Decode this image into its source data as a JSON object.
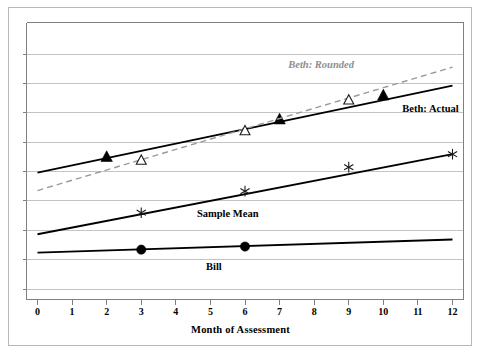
{
  "chart_data": {
    "type": "line",
    "title": "",
    "subtitle": "",
    "xlabel": "Month of Assessment",
    "ylabel": "",
    "xlim": [
      0,
      12
    ],
    "ylim": [
      0,
      9
    ],
    "grid": true,
    "grid_axis": "y",
    "y_tick_labels": [],
    "legend_position": "inline-annotations",
    "x_tick_labels": [
      "0",
      "1",
      "2",
      "3",
      "4",
      "5",
      "6",
      "7",
      "8",
      "9",
      "10",
      "11",
      "12"
    ],
    "x": [
      0,
      1,
      2,
      3,
      4,
      5,
      6,
      7,
      8,
      9,
      10,
      11,
      12
    ],
    "series": [
      {
        "name": "Beth: Actual",
        "label": "Beth: Actual",
        "style": "solid",
        "color": "#000000",
        "line_width": 1.8,
        "marker": "filled-triangle",
        "marker_points": [
          {
            "x": 2,
            "y": 4.63
          },
          {
            "x": 7,
            "y": 5.85
          },
          {
            "x": 10,
            "y": 6.63
          }
        ],
        "trend_endpoints": [
          {
            "x": 0,
            "y": 4.12
          },
          {
            "x": 12,
            "y": 6.95
          }
        ],
        "label_position": {
          "x": 10.55,
          "y": 6.2
        }
      },
      {
        "name": "Beth: Rounded",
        "label": "Beth: Rounded",
        "style": "dashed",
        "color": "#9a9a9a",
        "line_width": 1.4,
        "marker": "open-triangle",
        "marker_points": [
          {
            "x": 3,
            "y": 4.52
          },
          {
            "x": 6,
            "y": 5.48
          },
          {
            "x": 9,
            "y": 6.48
          }
        ],
        "trend_endpoints": [
          {
            "x": 0,
            "y": 3.54
          },
          {
            "x": 12,
            "y": 7.55
          }
        ],
        "label_position": {
          "x": 8.2,
          "y": 7.62
        }
      },
      {
        "name": "Sample Mean",
        "label": "Sample Mean",
        "style": "solid",
        "color": "#000000",
        "line_width": 1.8,
        "marker": "star",
        "marker_points": [
          {
            "x": 3,
            "y": 2.82
          },
          {
            "x": 6,
            "y": 3.52
          },
          {
            "x": 9,
            "y": 4.3
          },
          {
            "x": 12,
            "y": 4.72
          }
        ],
        "trend_endpoints": [
          {
            "x": 0,
            "y": 2.12
          },
          {
            "x": 12,
            "y": 4.72
          }
        ],
        "label_position": {
          "x": 5.5,
          "y": 2.78
        }
      },
      {
        "name": "Bill",
        "label": "Bill",
        "style": "solid",
        "color": "#000000",
        "line_width": 1.8,
        "marker": "filled-circle",
        "marker_points": [
          {
            "x": 3,
            "y": 1.62
          },
          {
            "x": 6,
            "y": 1.72
          }
        ],
        "trend_endpoints": [
          {
            "x": 0,
            "y": 1.52
          },
          {
            "x": 12,
            "y": 1.95
          }
        ],
        "label_position": {
          "x": 5.1,
          "y": 1.05
        }
      }
    ]
  },
  "colors": {
    "axis": "#808080",
    "grid": "#c4c4c4",
    "frame": "#b9b9b9",
    "ink": "#000000",
    "muted_ink": "#8e8e8e"
  }
}
